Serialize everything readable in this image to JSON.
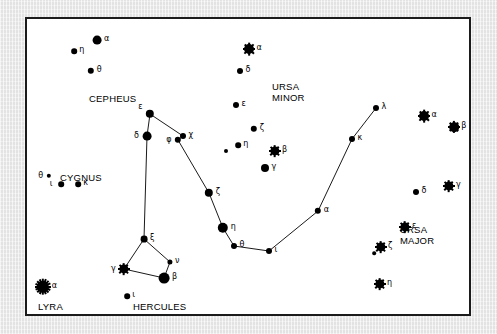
{
  "chart_data": {
    "type": "scatter",
    "xlabel": "",
    "ylabel": "",
    "xlim": [
      0,
      442
    ],
    "ylim": [
      0,
      295
    ],
    "grid": false,
    "legend": null,
    "constellation_labels": [
      {
        "name": "CEPHEUS",
        "x": 62,
        "y": 74,
        "lines": [
          "CEPHEUS"
        ]
      },
      {
        "name": "URSA MINOR",
        "x": 245,
        "y": 62,
        "lines": [
          "URSA",
          "MINOR"
        ]
      },
      {
        "name": "CYGNUS",
        "x": 33,
        "y": 153,
        "lines": [
          "CYGNUS"
        ]
      },
      {
        "name": "URSA MAJOR",
        "x": 373,
        "y": 205,
        "lines": [
          "URSA",
          "MAJOR"
        ]
      },
      {
        "name": "LYRA",
        "x": 11,
        "y": 282,
        "lines": [
          "LYRA"
        ]
      },
      {
        "name": "HERCULES",
        "x": 106,
        "y": 282,
        "lines": [
          "HERCULES"
        ]
      }
    ],
    "stars": [
      {
        "id": "cep-alpha",
        "constellation": "Cepheus",
        "bayer": "α",
        "x": 70,
        "y": 21,
        "size": 4.4,
        "burst": 0,
        "label_side": "right"
      },
      {
        "id": "cep-eta",
        "constellation": "Cepheus",
        "bayer": "η",
        "x": 47,
        "y": 32,
        "size": 2.8,
        "burst": 0,
        "label_side": "right"
      },
      {
        "id": "cep-theta",
        "constellation": "Cepheus",
        "bayer": "θ",
        "x": 64,
        "y": 52,
        "size": 3.2,
        "burst": 0,
        "label_side": "right"
      },
      {
        "id": "umi-alpha",
        "constellation": "Ursa Minor",
        "bayer": "α",
        "x": 222,
        "y": 30,
        "size": 5.0,
        "burst": 4,
        "label_side": "right"
      },
      {
        "id": "umi-delta",
        "constellation": "Ursa Minor",
        "bayer": "δ",
        "x": 213,
        "y": 52,
        "size": 3.0,
        "burst": 0,
        "label_side": "right"
      },
      {
        "id": "umi-eps",
        "constellation": "Ursa Minor",
        "bayer": "ε",
        "x": 209,
        "y": 86,
        "size": 3.0,
        "burst": 0,
        "label_side": "right"
      },
      {
        "id": "umi-zeta",
        "constellation": "Ursa Minor",
        "bayer": "ζ",
        "x": 227,
        "y": 110,
        "size": 3.2,
        "burst": 0,
        "label_side": "right"
      },
      {
        "id": "umi-eta",
        "constellation": "Ursa Minor",
        "bayer": "η",
        "x": 211,
        "y": 126,
        "size": 2.8,
        "burst": 0,
        "label_side": "right"
      },
      {
        "id": "umi-beta",
        "constellation": "Ursa Minor",
        "bayer": "β",
        "x": 248,
        "y": 132,
        "size": 4.6,
        "burst": 4,
        "label_side": "right"
      },
      {
        "id": "umi-gamma",
        "constellation": "Ursa Minor",
        "bayer": "γ",
        "x": 238,
        "y": 149,
        "size": 4.0,
        "burst": 0,
        "label_side": "right"
      },
      {
        "id": "umi-field",
        "constellation": "Ursa Minor",
        "bayer": "",
        "x": 199,
        "y": 132,
        "size": 2.0,
        "burst": 0,
        "label_side": "none"
      },
      {
        "id": "uma-alpha",
        "constellation": "Ursa Major",
        "bayer": "α",
        "x": 397,
        "y": 97,
        "size": 5.0,
        "burst": 4,
        "label_side": "right"
      },
      {
        "id": "uma-beta",
        "constellation": "Ursa Major",
        "bayer": "β",
        "x": 427,
        "y": 108,
        "size": 4.8,
        "burst": 4,
        "label_side": "right"
      },
      {
        "id": "uma-gamma",
        "constellation": "Ursa Major",
        "bayer": "γ",
        "x": 422,
        "y": 167,
        "size": 4.6,
        "burst": 4,
        "label_side": "right"
      },
      {
        "id": "uma-delta",
        "constellation": "Ursa Major",
        "bayer": "δ",
        "x": 389,
        "y": 173,
        "size": 3.0,
        "burst": 0,
        "label_side": "right"
      },
      {
        "id": "uma-eps",
        "constellation": "Ursa Major",
        "bayer": "ε",
        "x": 378,
        "y": 208,
        "size": 4.6,
        "burst": 4,
        "label_side": "right"
      },
      {
        "id": "uma-zeta",
        "constellation": "Ursa Major",
        "bayer": "ζ",
        "x": 354,
        "y": 228,
        "size": 4.6,
        "burst": 4,
        "label_side": "right"
      },
      {
        "id": "uma-alcor",
        "constellation": "Ursa Major",
        "bayer": "",
        "x": 347,
        "y": 234,
        "size": 1.8,
        "burst": 0,
        "label_side": "none"
      },
      {
        "id": "uma-eta",
        "constellation": "Ursa Major",
        "bayer": "η",
        "x": 353,
        "y": 265,
        "size": 4.6,
        "burst": 4,
        "label_side": "right"
      },
      {
        "id": "dra-lambda",
        "constellation": "Draco",
        "bayer": "λ",
        "x": 349,
        "y": 89,
        "size": 3.0,
        "burst": 0,
        "label_side": "right"
      },
      {
        "id": "dra-kappa",
        "constellation": "Draco",
        "bayer": "κ",
        "x": 325,
        "y": 120,
        "size": 3.0,
        "burst": 0,
        "label_side": "right"
      },
      {
        "id": "dra-alpha",
        "constellation": "Draco",
        "bayer": "α",
        "x": 291,
        "y": 192,
        "size": 3.2,
        "burst": 0,
        "label_side": "right"
      },
      {
        "id": "dra-iota",
        "constellation": "Draco",
        "bayer": "ι",
        "x": 242,
        "y": 232,
        "size": 3.0,
        "burst": 0,
        "label_side": "right"
      },
      {
        "id": "dra-theta",
        "constellation": "Draco",
        "bayer": "θ",
        "x": 207,
        "y": 227,
        "size": 3.0,
        "burst": 0,
        "label_side": "right"
      },
      {
        "id": "dra-eta",
        "constellation": "Draco",
        "bayer": "η",
        "x": 196,
        "y": 209,
        "size": 5.2,
        "burst": 0,
        "label_side": "right"
      },
      {
        "id": "dra-zeta",
        "constellation": "Draco",
        "bayer": "ζ",
        "x": 182,
        "y": 174,
        "size": 4.2,
        "burst": 0,
        "label_side": "right"
      },
      {
        "id": "dra-chi",
        "constellation": "Draco",
        "bayer": "χ",
        "x": 156,
        "y": 117,
        "size": 3.0,
        "burst": 0,
        "label_side": "right"
      },
      {
        "id": "dra-phi",
        "constellation": "Draco",
        "bayer": "φ",
        "x": 151,
        "y": 121,
        "size": 3.2,
        "burst": 0,
        "label_side": "left"
      },
      {
        "id": "dra-eps",
        "constellation": "Draco",
        "bayer": "ε",
        "x": 123,
        "y": 95,
        "size": 4.2,
        "burst": 0,
        "label_side": "topleft"
      },
      {
        "id": "dra-delta",
        "constellation": "Draco",
        "bayer": "δ",
        "x": 120,
        "y": 117,
        "size": 4.4,
        "burst": 0,
        "label_side": "left"
      },
      {
        "id": "her-xi",
        "constellation": "Hercules",
        "bayer": "ξ",
        "x": 117,
        "y": 220,
        "size": 3.4,
        "burst": 0,
        "label_side": "right"
      },
      {
        "id": "her-nu",
        "constellation": "Hercules",
        "bayer": "ν",
        "x": 143,
        "y": 243,
        "size": 2.6,
        "burst": 0,
        "label_side": "right"
      },
      {
        "id": "her-beta",
        "constellation": "Hercules",
        "bayer": "β",
        "x": 137,
        "y": 259,
        "size": 5.4,
        "burst": 0,
        "label_side": "right"
      },
      {
        "id": "her-gamma",
        "constellation": "Hercules",
        "bayer": "γ",
        "x": 97,
        "y": 250,
        "size": 4.6,
        "burst": 4,
        "label_side": "left"
      },
      {
        "id": "her-iota",
        "constellation": "Hercules",
        "bayer": "ι",
        "x": 100,
        "y": 277,
        "size": 2.8,
        "burst": 0,
        "label_side": "right"
      },
      {
        "id": "cyg-theta",
        "constellation": "Cygnus",
        "bayer": "θ",
        "x": 22,
        "y": 157,
        "size": 2.2,
        "burst": 0,
        "label_side": "left"
      },
      {
        "id": "cyg-iota",
        "constellation": "Cygnus",
        "bayer": "ι",
        "x": 34,
        "y": 165,
        "size": 2.8,
        "burst": 0,
        "label_side": "left"
      },
      {
        "id": "cyg-kappa",
        "constellation": "Cygnus",
        "bayer": "κ",
        "x": 51,
        "y": 165,
        "size": 2.8,
        "burst": 0,
        "label_side": "right"
      },
      {
        "id": "lyr-alpha",
        "constellation": "Lyra",
        "bayer": "α",
        "x": 16,
        "y": 268,
        "size": 6.2,
        "burst": 8,
        "label_side": "right"
      }
    ],
    "constellation_lines": [
      {
        "name": "draco-spine",
        "points": [
          "dra-eps",
          "dra-delta",
          "her-xi"
        ]
      },
      {
        "name": "draco-body",
        "points": [
          "dra-eps",
          "dra-chi",
          "dra-phi",
          "dra-zeta",
          "dra-eta",
          "dra-theta",
          "dra-iota",
          "dra-alpha",
          "dra-kappa",
          "dra-lambda"
        ]
      },
      {
        "name": "hercules-keystone",
        "points": [
          "her-xi",
          "her-nu",
          "her-beta",
          "her-gamma",
          "her-xi"
        ]
      }
    ]
  }
}
